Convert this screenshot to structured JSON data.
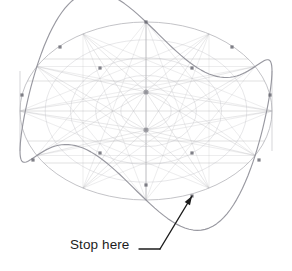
{
  "figure": {
    "background_color": "#ffffff",
    "construction_line_color": "#b9b9bd",
    "wave_curve_color": "#8f8f98",
    "vertex_dot_color": "#6b6b74",
    "annotation_color": "#1c1c1c"
  },
  "annotation": {
    "label": "Stop here",
    "label_x": 70,
    "label_y": 238,
    "leader": {
      "dash_start_x": 139,
      "dash_start_y": 249,
      "dash_end_x": 160,
      "dash_end_y": 249,
      "arrow_start_x": 160,
      "arrow_start_y": 249,
      "arrow_tip_x": 192,
      "arrow_tip_y": 196
    }
  },
  "chart_data": {
    "type": "line",
    "xlabel": "",
    "ylabel": "",
    "grid": true,
    "legend": null,
    "ellipse": {
      "center_x": 146,
      "center_y": 111,
      "radius_x": 126,
      "radius_y": 89
    },
    "hubs": [
      {
        "name": "upper-hub",
        "x": 146,
        "y": 92
      },
      {
        "name": "lower-hub",
        "x": 146,
        "y": 130
      }
    ],
    "wave": {
      "periods": 3,
      "amplitude": 40,
      "samples": 180,
      "peak_angles_deg": [
        90,
        210,
        330
      ],
      "trough_angles_deg": [
        30,
        150,
        270
      ]
    },
    "concentric_ellipse_scales": [
      0.2,
      0.4,
      0.6,
      0.8,
      1.0
    ],
    "radial_spoke_count": 12,
    "horizontal_chord_offsets": [
      -52,
      -30,
      0,
      30,
      52
    ],
    "vertices": [
      {
        "label": "peak-top-left",
        "x": 60,
        "y": 47
      },
      {
        "label": "peak-top-center",
        "x": 146,
        "y": 22
      },
      {
        "label": "peak-top-right",
        "x": 232,
        "y": 47
      },
      {
        "label": "trough-upper-left",
        "x": 100,
        "y": 68
      },
      {
        "label": "trough-upper-right",
        "x": 192,
        "y": 68
      },
      {
        "label": "left-edge-upper",
        "x": 22,
        "y": 95
      },
      {
        "label": "right-edge-upper",
        "x": 270,
        "y": 95
      },
      {
        "label": "left-edge-lower",
        "x": 33,
        "y": 160
      },
      {
        "label": "right-edge-lower",
        "x": 259,
        "y": 160
      },
      {
        "label": "peak-bottom-left",
        "x": 100,
        "y": 153
      },
      {
        "label": "peak-bottom-right",
        "x": 192,
        "y": 153
      },
      {
        "label": "trough-bottom-center",
        "x": 146,
        "y": 185
      },
      {
        "label": "stop-here-vertex",
        "x": 192,
        "y": 196
      }
    ]
  }
}
